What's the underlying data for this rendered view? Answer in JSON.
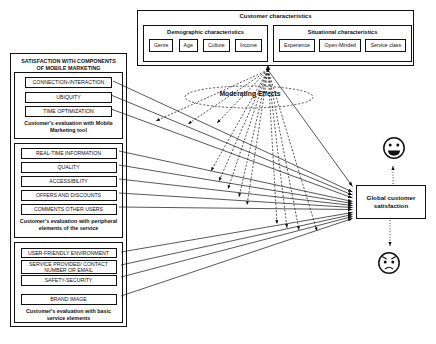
{
  "customer_characteristics": {
    "title": "Customer characteristics",
    "groups": [
      {
        "title": "Demographic characteristics",
        "items": [
          "Genre",
          "Age",
          "Culture",
          "Income"
        ]
      },
      {
        "title": "Situational characteristics",
        "items": [
          "Experience",
          "Open-Minded",
          "Service class"
        ]
      }
    ]
  },
  "satisfaction_panel": {
    "title": "SATISFACTION WITH COMPONENTS OF MOBILE MARKETING",
    "groups": [
      {
        "items": [
          "CONNECTION-INTERACTION",
          "UBIQUITY",
          "TIME OPTIMIZATION"
        ],
        "caption": "Customer's evaluation with Mobile Marketing tool"
      },
      {
        "items": [
          "REAL-TIME INFORMATION",
          "QUALITY",
          "ACCESSIBILITY",
          "OFFERS AND DISCOUNTS",
          "COMMENTS OTHER USERS"
        ],
        "caption": "Customer's evaluation with peripheral elements of the service"
      },
      {
        "items": [
          "USER-FRIENDLY ENVIRONMENT",
          "SERVICE PROVIDED/ CONTACT NUMBER OR EMAIL",
          "SAFETY-SECURITY",
          "BRAND IMAGE"
        ],
        "caption": "Customer's evaluation with basic service elements"
      }
    ]
  },
  "moderating": {
    "label": "Moderating Effects",
    "source": "Customer characteristics",
    "line_style": "dashed"
  },
  "outcome": {
    "label": "Global customer satisfaction"
  },
  "icons": {
    "above_outcome": "happy-face-icon",
    "below_outcome": "angry-face-icon"
  },
  "edges": {
    "solid_sources_to_outcome": [
      "Customer characteristics",
      "CONNECTION-INTERACTION",
      "UBIQUITY",
      "TIME OPTIMIZATION",
      "REAL-TIME INFORMATION",
      "QUALITY",
      "ACCESSIBILITY",
      "OFFERS AND DISCOUNTS",
      "COMMENTS OTHER USERS",
      "USER-FRIENDLY ENVIRONMENT",
      "SERVICE PROVIDED/ CONTACT NUMBER OR EMAIL",
      "SAFETY-SECURITY",
      "BRAND IMAGE"
    ]
  },
  "colors": {
    "ink": "#111111",
    "background": "#ffffff"
  }
}
